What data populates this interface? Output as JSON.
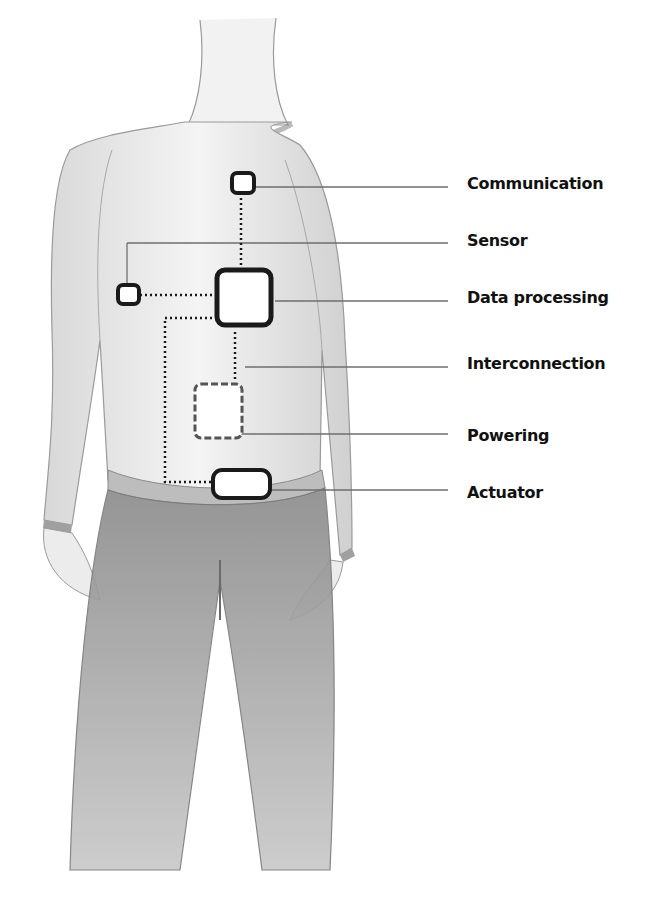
{
  "diagram": {
    "type": "wearable-electronics-schematic",
    "illustration": "pencil sketch of a person wearing a long-sleeve shirt and trousers",
    "components": [
      {
        "id": "communication",
        "label": "Communication",
        "shape": "small rounded square",
        "line_style": "solid"
      },
      {
        "id": "sensor",
        "label": "Sensor",
        "shape": "small rounded square",
        "line_style": "solid"
      },
      {
        "id": "data_processing",
        "label": "Data processing",
        "shape": "large rounded square",
        "line_style": "solid"
      },
      {
        "id": "interconnection",
        "label": "Interconnection",
        "shape": "dotted lines",
        "line_style": "dotted"
      },
      {
        "id": "powering",
        "label": "Powering",
        "shape": "medium rounded square",
        "line_style": "dashed"
      },
      {
        "id": "actuator",
        "label": "Actuator",
        "shape": "wide rounded rectangle",
        "line_style": "solid"
      }
    ],
    "colors": {
      "component_stroke": "#1a1a1a",
      "powering_stroke": "#555555",
      "leader_line": "#6e6e6e",
      "sketch": "#9a9a9a",
      "label_text": "#111111"
    }
  }
}
